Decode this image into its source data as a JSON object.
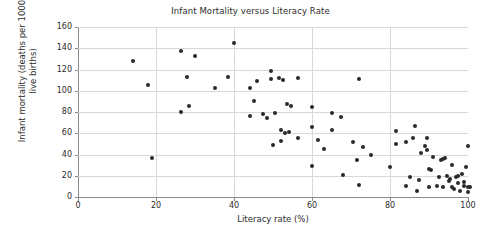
{
  "chart_data": {
    "type": "scatter",
    "title": "Infant Mortality versus Literacy Rate",
    "xlabel": "Literacy rate (%)",
    "ylabel": "Infant mortality (deaths per 1000 live births)",
    "xlim": [
      0,
      100
    ],
    "ylim": [
      0,
      160
    ],
    "xticks": [
      0,
      20,
      40,
      60,
      80,
      100
    ],
    "yticks": [
      0,
      20,
      40,
      60,
      80,
      100,
      120,
      140,
      160
    ],
    "grid": true,
    "legend": null,
    "marker_color": "#2a2a2a",
    "points": [
      [
        14,
        128
      ],
      [
        18,
        105
      ],
      [
        19,
        37
      ],
      [
        26.5,
        137
      ],
      [
        26.5,
        80
      ],
      [
        28,
        113
      ],
      [
        28.5,
        86
      ],
      [
        30,
        133
      ],
      [
        35,
        103
      ],
      [
        38.5,
        113
      ],
      [
        40,
        145
      ],
      [
        44,
        103
      ],
      [
        44,
        76
      ],
      [
        45,
        90
      ],
      [
        46,
        109
      ],
      [
        47.5,
        78
      ],
      [
        48.5,
        74
      ],
      [
        49.5,
        119
      ],
      [
        49.5,
        111
      ],
      [
        50,
        49
      ],
      [
        50.5,
        79
      ],
      [
        51.5,
        112
      ],
      [
        52,
        63
      ],
      [
        52,
        53
      ],
      [
        52.5,
        110
      ],
      [
        53,
        60
      ],
      [
        53.5,
        88
      ],
      [
        54,
        61
      ],
      [
        54.5,
        86
      ],
      [
        56.5,
        112
      ],
      [
        56.5,
        56
      ],
      [
        60,
        85
      ],
      [
        60,
        66
      ],
      [
        60,
        29
      ],
      [
        61.5,
        54
      ],
      [
        63,
        45
      ],
      [
        65,
        79
      ],
      [
        65,
        63
      ],
      [
        67.5,
        75
      ],
      [
        68,
        21
      ],
      [
        70.5,
        52
      ],
      [
        71.5,
        35
      ],
      [
        72,
        111
      ],
      [
        72,
        11
      ],
      [
        73,
        47
      ],
      [
        75,
        40
      ],
      [
        80,
        28
      ],
      [
        81.5,
        62
      ],
      [
        81.5,
        50
      ],
      [
        84,
        52
      ],
      [
        84,
        10
      ],
      [
        85,
        19
      ],
      [
        86,
        56
      ],
      [
        86.5,
        67
      ],
      [
        87,
        6
      ],
      [
        87.5,
        16
      ],
      [
        88,
        41
      ],
      [
        89,
        48
      ],
      [
        89.5,
        56
      ],
      [
        89.5,
        44
      ],
      [
        90,
        26
      ],
      [
        90.5,
        25
      ],
      [
        90,
        9
      ],
      [
        91,
        38
      ],
      [
        92,
        10
      ],
      [
        92.5,
        19
      ],
      [
        93,
        35
      ],
      [
        93.5,
        36
      ],
      [
        93.5,
        9
      ],
      [
        94,
        37
      ],
      [
        94.5,
        20
      ],
      [
        95,
        15
      ],
      [
        95.5,
        17
      ],
      [
        96,
        30
      ],
      [
        96,
        9
      ],
      [
        96.5,
        8
      ],
      [
        97,
        19
      ],
      [
        97.5,
        13
      ],
      [
        97.5,
        20
      ],
      [
        98,
        6
      ],
      [
        98.5,
        22
      ],
      [
        99,
        10
      ],
      [
        99,
        14
      ],
      [
        99.5,
        28
      ],
      [
        100,
        48
      ],
      [
        100,
        5
      ],
      [
        100,
        9
      ],
      [
        100.5,
        9
      ]
    ]
  }
}
